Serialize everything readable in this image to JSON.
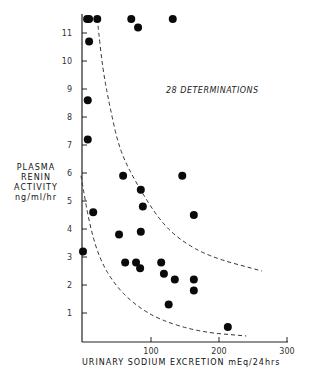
{
  "chart_data": {
    "type": "scatter",
    "title": "",
    "annotation": "28 DETERMINATIONS",
    "xlabel": "URINARY SODIUM EXCRETION  mEq/24hrs",
    "ylabel_lines": [
      "PLASMA",
      "RENIN",
      "ACTIVITY",
      "ng/ml/hr"
    ],
    "xlim": [
      0,
      300
    ],
    "ylim": [
      0,
      11.5
    ],
    "x_ticks": [
      100,
      200,
      300
    ],
    "y_ticks": [
      1,
      2,
      3,
      4,
      5,
      6,
      7,
      8,
      9,
      10,
      11
    ],
    "grid": false,
    "legend": null,
    "series": [
      {
        "name": "determinations",
        "points": [
          {
            "x": 6,
            "y": 11.5
          },
          {
            "x": 9,
            "y": 11.5
          },
          {
            "x": 21,
            "y": 11.5
          },
          {
            "x": 71,
            "y": 11.5
          },
          {
            "x": 132,
            "y": 11.5
          },
          {
            "x": 81,
            "y": 11.2
          },
          {
            "x": 9,
            "y": 10.7
          },
          {
            "x": 7,
            "y": 8.6
          },
          {
            "x": 7,
            "y": 7.2
          },
          {
            "x": 59,
            "y": 5.9
          },
          {
            "x": 146,
            "y": 5.9
          },
          {
            "x": 85,
            "y": 5.4
          },
          {
            "x": 88,
            "y": 4.8
          },
          {
            "x": 163,
            "y": 4.5
          },
          {
            "x": 15,
            "y": 4.6
          },
          {
            "x": 53,
            "y": 3.8
          },
          {
            "x": 85,
            "y": 3.9
          },
          {
            "x": 0,
            "y": 3.2
          },
          {
            "x": 62,
            "y": 2.8
          },
          {
            "x": 78,
            "y": 2.8
          },
          {
            "x": 84,
            "y": 2.6
          },
          {
            "x": 115,
            "y": 2.8
          },
          {
            "x": 119,
            "y": 2.4
          },
          {
            "x": 135,
            "y": 2.2
          },
          {
            "x": 163,
            "y": 2.2
          },
          {
            "x": 163,
            "y": 1.8
          },
          {
            "x": 126,
            "y": 1.3
          },
          {
            "x": 213,
            "y": 0.5
          }
        ]
      }
    ],
    "curves": [
      {
        "name": "upper-bound",
        "style": "dashed",
        "points": [
          [
            21,
            11.5
          ],
          [
            29,
            9.7
          ],
          [
            40,
            8.3
          ],
          [
            54,
            6.8
          ],
          [
            79,
            5.6
          ],
          [
            113,
            4.3
          ],
          [
            143,
            3.6
          ],
          [
            187,
            3.0
          ],
          [
            263,
            2.5
          ]
        ]
      },
      {
        "name": "lower-bound",
        "style": "dashed",
        "points": [
          [
            -3,
            5.9
          ],
          [
            10,
            4.1
          ],
          [
            25,
            2.9
          ],
          [
            47,
            2.0
          ],
          [
            76,
            1.3
          ],
          [
            113,
            0.75
          ],
          [
            172,
            0.32
          ],
          [
            240,
            0.18
          ]
        ]
      }
    ]
  }
}
